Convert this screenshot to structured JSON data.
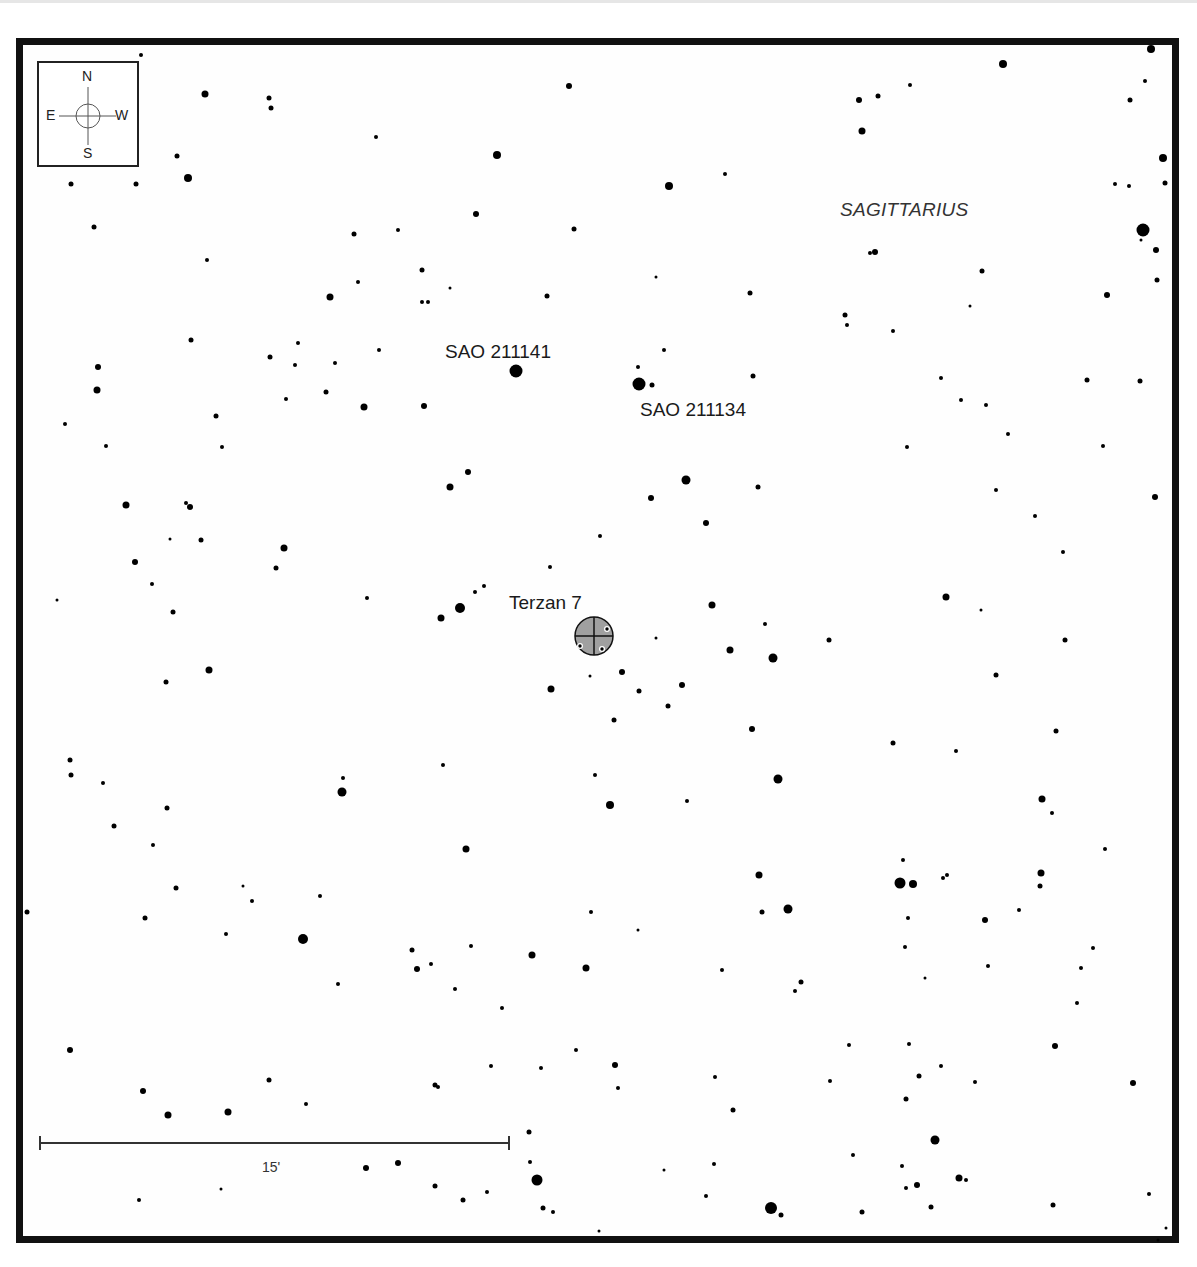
{
  "chart": {
    "constellation": "SAGITTARIUS",
    "target": {
      "name": "Terzan 7",
      "type": "globular-cluster",
      "x": 594,
      "y": 636,
      "r": 19,
      "fill": "#a0a0a0"
    },
    "labels": [
      {
        "id": "sao-211141",
        "text": "SAO 211141",
        "x": 445,
        "y": 341
      },
      {
        "id": "sao-211134",
        "text": "SAO 211134",
        "x": 640,
        "y": 399
      },
      {
        "id": "terzan-7",
        "text": "Terzan 7",
        "x": 509,
        "y": 592
      }
    ],
    "constellation_label": {
      "text": "SAGITTARIUS",
      "x": 840,
      "y": 199
    },
    "compass": {
      "n": "N",
      "s": "S",
      "e": "E",
      "w": "W"
    },
    "scale_bar": {
      "label": "15'",
      "x1": 40,
      "x2": 509,
      "y": 1143
    },
    "colors": {
      "frame": "#111111",
      "star": "#000000",
      "cluster": "#a0a0a0",
      "text": "#1a1a1a"
    }
  },
  "stars": [
    [
      141,
      55,
      2
    ],
    [
      205,
      94,
      3.5
    ],
    [
      269,
      98,
      2.5
    ],
    [
      271,
      108,
      2.5
    ],
    [
      569,
      86,
      3
    ],
    [
      1003,
      64,
      4
    ],
    [
      1151,
      49,
      4
    ],
    [
      859,
      100,
      3
    ],
    [
      878,
      96,
      2.5
    ],
    [
      910,
      85,
      2
    ],
    [
      1145,
      81,
      2
    ],
    [
      1130,
      100,
      2.5
    ],
    [
      862,
      131,
      3.5
    ],
    [
      1163,
      158,
      4
    ],
    [
      376,
      137,
      2
    ],
    [
      497,
      155,
      4
    ],
    [
      177,
      156,
      2.5
    ],
    [
      188,
      178,
      4
    ],
    [
      71,
      184,
      2.5
    ],
    [
      136,
      184,
      2.5
    ],
    [
      669,
      186,
      4
    ],
    [
      725,
      174,
      2
    ],
    [
      1115,
      184,
      2
    ],
    [
      1129,
      186,
      2
    ],
    [
      1165,
      183,
      2.5
    ],
    [
      476,
      214,
      3
    ],
    [
      94,
      227,
      2.5
    ],
    [
      354,
      234,
      2.5
    ],
    [
      398,
      230,
      2
    ],
    [
      574,
      229,
      2.5
    ],
    [
      1143,
      230,
      6.5
    ],
    [
      1156,
      250,
      3
    ],
    [
      1141,
      240,
      1.5
    ],
    [
      207,
      260,
      2
    ],
    [
      870,
      253,
      2
    ],
    [
      875,
      252,
      3
    ],
    [
      422,
      270,
      2.5
    ],
    [
      656,
      277,
      1.5
    ],
    [
      982,
      271,
      2.5
    ],
    [
      1157,
      280,
      2.5
    ],
    [
      358,
      282,
      2
    ],
    [
      450,
      288,
      1.5
    ],
    [
      330,
      297,
      3.5
    ],
    [
      422,
      302,
      2
    ],
    [
      428,
      302,
      2
    ],
    [
      547,
      296,
      2.5
    ],
    [
      750,
      293,
      2.5
    ],
    [
      1107,
      295,
      3
    ],
    [
      845,
      315,
      2.5
    ],
    [
      847,
      325,
      2
    ],
    [
      191,
      340,
      2.5
    ],
    [
      298,
      343,
      2
    ],
    [
      893,
      331,
      2
    ],
    [
      970,
      306,
      1.5
    ],
    [
      379,
      350,
      2
    ],
    [
      270,
      357,
      2.5
    ],
    [
      335,
      363,
      2
    ],
    [
      295,
      365,
      2
    ],
    [
      516,
      371,
      6.5
    ],
    [
      639,
      384,
      6.5
    ],
    [
      652,
      385,
      2.5
    ],
    [
      638,
      367,
      2
    ],
    [
      664,
      350,
      2
    ],
    [
      753,
      376,
      2.5
    ],
    [
      98,
      367,
      3
    ],
    [
      97,
      390,
      3.5
    ],
    [
      326,
      392,
      2.5
    ],
    [
      941,
      378,
      2
    ],
    [
      1087,
      380,
      2.5
    ],
    [
      1140,
      381,
      2.5
    ],
    [
      286,
      399,
      2
    ],
    [
      364,
      407,
      3.5
    ],
    [
      424,
      406,
      3
    ],
    [
      961,
      400,
      2
    ],
    [
      986,
      405,
      2
    ],
    [
      216,
      416,
      2.5
    ],
    [
      65,
      424,
      2
    ],
    [
      1008,
      434,
      2
    ],
    [
      106,
      446,
      2
    ],
    [
      222,
      447,
      2
    ],
    [
      907,
      447,
      2
    ],
    [
      1103,
      446,
      2
    ],
    [
      468,
      472,
      3
    ],
    [
      686,
      480,
      4.5
    ],
    [
      450,
      487,
      3.5
    ],
    [
      758,
      487,
      2.5
    ],
    [
      996,
      490,
      2
    ],
    [
      651,
      498,
      3
    ],
    [
      1155,
      497,
      3
    ],
    [
      126,
      505,
      3.5
    ],
    [
      186,
      503,
      2
    ],
    [
      190,
      507,
      3
    ],
    [
      706,
      523,
      3
    ],
    [
      1035,
      516,
      2
    ],
    [
      170,
      539,
      1.5
    ],
    [
      201,
      540,
      2.5
    ],
    [
      284,
      548,
      3.5
    ],
    [
      600,
      536,
      2
    ],
    [
      1063,
      552,
      2
    ],
    [
      135,
      562,
      3
    ],
    [
      276,
      568,
      2.5
    ],
    [
      550,
      567,
      2
    ],
    [
      484,
      586,
      2
    ],
    [
      475,
      592,
      2
    ],
    [
      152,
      584,
      2
    ],
    [
      57,
      600,
      1.5
    ],
    [
      367,
      598,
      2
    ],
    [
      460,
      608,
      5
    ],
    [
      441,
      618,
      3.5
    ],
    [
      712,
      605,
      3.5
    ],
    [
      946,
      597,
      3.5
    ],
    [
      981,
      610,
      1.5
    ],
    [
      173,
      612,
      2.5
    ],
    [
      765,
      624,
      2
    ],
    [
      656,
      638,
      1.5
    ],
    [
      829,
      640,
      2.5
    ],
    [
      1065,
      640,
      2.5
    ],
    [
      730,
      650,
      3.5
    ],
    [
      773,
      658,
      4.5
    ],
    [
      622,
      672,
      3
    ],
    [
      209,
      670,
      3.5
    ],
    [
      590,
      676,
      1.5
    ],
    [
      996,
      675,
      2.5
    ],
    [
      166,
      682,
      2.5
    ],
    [
      551,
      689,
      3.5
    ],
    [
      639,
      691,
      2.5
    ],
    [
      682,
      685,
      3
    ],
    [
      668,
      706,
      2.5
    ],
    [
      614,
      720,
      2.5
    ],
    [
      752,
      729,
      3
    ],
    [
      1056,
      731,
      2.5
    ],
    [
      893,
      743,
      2.5
    ],
    [
      956,
      751,
      2
    ],
    [
      70,
      760,
      2.5
    ],
    [
      443,
      765,
      2
    ],
    [
      595,
      775,
      2
    ],
    [
      778,
      779,
      4.5
    ],
    [
      71,
      775,
      2.5
    ],
    [
      343,
      778,
      2
    ],
    [
      342,
      792,
      4.5
    ],
    [
      103,
      783,
      2
    ],
    [
      1042,
      799,
      3.5
    ],
    [
      1052,
      813,
      2
    ],
    [
      610,
      805,
      4
    ],
    [
      687,
      801,
      2
    ],
    [
      167,
      808,
      2.5
    ],
    [
      114,
      826,
      2.5
    ],
    [
      153,
      845,
      2
    ],
    [
      466,
      849,
      3.5
    ],
    [
      1105,
      849,
      2
    ],
    [
      903,
      860,
      2
    ],
    [
      759,
      875,
      3.5
    ],
    [
      900,
      883,
      5.5
    ],
    [
      913,
      884,
      4
    ],
    [
      943,
      878,
      2
    ],
    [
      947,
      875,
      2
    ],
    [
      1041,
      873,
      3.5
    ],
    [
      1040,
      886,
      2.5
    ],
    [
      176,
      888,
      2.5
    ],
    [
      243,
      886,
      1.5
    ],
    [
      252,
      901,
      2
    ],
    [
      320,
      896,
      2
    ],
    [
      27,
      912,
      2.5
    ],
    [
      591,
      912,
      2
    ],
    [
      762,
      912,
      2.5
    ],
    [
      788,
      909,
      4.5
    ],
    [
      985,
      920,
      3
    ],
    [
      1019,
      910,
      2
    ],
    [
      908,
      918,
      2
    ],
    [
      145,
      918,
      2.5
    ],
    [
      303,
      939,
      5
    ],
    [
      638,
      930,
      1.5
    ],
    [
      226,
      934,
      2
    ],
    [
      905,
      947,
      2
    ],
    [
      412,
      950,
      2.5
    ],
    [
      471,
      946,
      2
    ],
    [
      532,
      955,
      3.5
    ],
    [
      1093,
      948,
      2
    ],
    [
      417,
      969,
      3
    ],
    [
      431,
      964,
      2
    ],
    [
      586,
      968,
      3.5
    ],
    [
      722,
      970,
      2
    ],
    [
      988,
      966,
      2
    ],
    [
      1081,
      968,
      2
    ],
    [
      925,
      978,
      1.5
    ],
    [
      801,
      982,
      2.5
    ],
    [
      795,
      991,
      2
    ],
    [
      338,
      984,
      2
    ],
    [
      455,
      989,
      2
    ],
    [
      1077,
      1003,
      2
    ],
    [
      502,
      1008,
      2
    ],
    [
      849,
      1045,
      2
    ],
    [
      909,
      1044,
      2
    ],
    [
      1055,
      1046,
      3
    ],
    [
      70,
      1050,
      3
    ],
    [
      576,
      1050,
      2
    ],
    [
      491,
      1066,
      2
    ],
    [
      615,
      1065,
      3
    ],
    [
      541,
      1068,
      2
    ],
    [
      715,
      1077,
      2
    ],
    [
      941,
      1066,
      2
    ],
    [
      1133,
      1083,
      3
    ],
    [
      143,
      1091,
      3
    ],
    [
      269,
      1080,
      2.5
    ],
    [
      435,
      1085,
      2.5
    ],
    [
      438,
      1087,
      2
    ],
    [
      618,
      1088,
      2
    ],
    [
      830,
      1081,
      2
    ],
    [
      919,
      1076,
      2.5
    ],
    [
      975,
      1082,
      2
    ],
    [
      906,
      1099,
      2.5
    ],
    [
      733,
      1110,
      2.5
    ],
    [
      168,
      1115,
      3.5
    ],
    [
      228,
      1112,
      3.5
    ],
    [
      306,
      1104,
      2
    ],
    [
      529,
      1132,
      2.5
    ],
    [
      935,
      1140,
      4.5
    ],
    [
      530,
      1162,
      2
    ],
    [
      853,
      1155,
      2
    ],
    [
      366,
      1168,
      3
    ],
    [
      398,
      1163,
      3
    ],
    [
      664,
      1170,
      1.5
    ],
    [
      714,
      1164,
      2
    ],
    [
      902,
      1166,
      2
    ],
    [
      959,
      1178,
      3.5
    ],
    [
      537,
      1180,
      5.5
    ],
    [
      221,
      1189,
      1.5
    ],
    [
      435,
      1186,
      2.5
    ],
    [
      487,
      1192,
      2
    ],
    [
      917,
      1185,
      3
    ],
    [
      966,
      1180,
      2
    ],
    [
      906,
      1188,
      2
    ],
    [
      139,
      1200,
      2
    ],
    [
      463,
      1200,
      2.5
    ],
    [
      543,
      1208,
      2.5
    ],
    [
      553,
      1212,
      2
    ],
    [
      706,
      1196,
      2
    ],
    [
      771,
      1208,
      6
    ],
    [
      781,
      1215,
      2.5
    ],
    [
      862,
      1212,
      2.5
    ],
    [
      931,
      1207,
      2.5
    ],
    [
      1053,
      1205,
      2.5
    ],
    [
      1149,
      1194,
      2
    ],
    [
      599,
      1231,
      1.5
    ],
    [
      1158,
      1240,
      1.5
    ],
    [
      1166,
      1228,
      1.5
    ]
  ]
}
